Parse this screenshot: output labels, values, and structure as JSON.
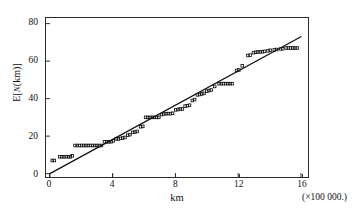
{
  "figure": {
    "background_color": "#ffffff",
    "ink_color": "#111111",
    "frame_color": "#2b2b2b"
  },
  "axes": {
    "y_title_prefix": "E[",
    "y_title_n": "N",
    "y_title_suffix": "(km)]",
    "x_title": "km",
    "x_multiplier": "(×100 000.)"
  },
  "chart_data": {
    "type": "scatter",
    "title": "",
    "subtitle": "",
    "xlabel": "km",
    "ylabel": "E[N(km)]",
    "x_multiplier_note": "(×100 000.)",
    "xlim": [
      -0.25,
      16.45
    ],
    "ylim": [
      -1.8,
      83.0
    ],
    "xticks": [
      0,
      4,
      8,
      12,
      16
    ],
    "xticklabels": [
      "0",
      "4",
      "8",
      "12",
      "16"
    ],
    "yticks": [
      0,
      20,
      40,
      60,
      80
    ],
    "yticklabels": [
      "0",
      "20",
      "40",
      "60",
      "80"
    ],
    "grid": false,
    "legend": null,
    "legend_position": "none",
    "marker": "open-square",
    "marker_size_px": 2.6,
    "series": [
      {
        "name": "empirical",
        "type": "scatter",
        "marker": "open-square",
        "color": "#111111",
        "points": [
          [
            0.15,
            7.0
          ],
          [
            0.28,
            7.0
          ],
          [
            0.62,
            9.0
          ],
          [
            0.76,
            9.0
          ],
          [
            0.9,
            9.0
          ],
          [
            1.04,
            9.0
          ],
          [
            1.18,
            9.0
          ],
          [
            1.3,
            9.0
          ],
          [
            1.42,
            9.5
          ],
          [
            1.6,
            15.0
          ],
          [
            1.74,
            15.0
          ],
          [
            1.88,
            15.0
          ],
          [
            2.02,
            15.0
          ],
          [
            2.16,
            15.0
          ],
          [
            2.3,
            15.0
          ],
          [
            2.44,
            15.0
          ],
          [
            2.58,
            15.0
          ],
          [
            2.72,
            15.0
          ],
          [
            2.86,
            15.0
          ],
          [
            3.0,
            15.0
          ],
          [
            3.14,
            15.0
          ],
          [
            3.28,
            15.0
          ],
          [
            3.48,
            17.0
          ],
          [
            3.62,
            17.0
          ],
          [
            3.76,
            17.0
          ],
          [
            3.9,
            17.0
          ],
          [
            4.04,
            17.5
          ],
          [
            4.22,
            18.5
          ],
          [
            4.36,
            18.5
          ],
          [
            4.5,
            18.8
          ],
          [
            4.64,
            19.0
          ],
          [
            4.78,
            19.3
          ],
          [
            4.96,
            20.5
          ],
          [
            5.1,
            20.8
          ],
          [
            5.28,
            22.0
          ],
          [
            5.42,
            22.2
          ],
          [
            5.56,
            22.5
          ],
          [
            5.78,
            25.0
          ],
          [
            5.92,
            25.2
          ],
          [
            6.1,
            30.0
          ],
          [
            6.24,
            30.0
          ],
          [
            6.38,
            30.0
          ],
          [
            6.52,
            30.0
          ],
          [
            6.66,
            30.0
          ],
          [
            6.8,
            30.0
          ],
          [
            6.94,
            30.0
          ],
          [
            7.12,
            31.5
          ],
          [
            7.26,
            31.8
          ],
          [
            7.4,
            32.0
          ],
          [
            7.54,
            32.0
          ],
          [
            7.68,
            32.0
          ],
          [
            7.82,
            32.2
          ],
          [
            8.02,
            34.0
          ],
          [
            8.16,
            34.2
          ],
          [
            8.3,
            34.5
          ],
          [
            8.44,
            34.5
          ],
          [
            8.62,
            36.0
          ],
          [
            8.76,
            36.2
          ],
          [
            8.9,
            36.5
          ],
          [
            9.08,
            39.0
          ],
          [
            9.22,
            39.5
          ],
          [
            9.4,
            42.0
          ],
          [
            9.54,
            42.2
          ],
          [
            9.68,
            42.5
          ],
          [
            9.82,
            42.8
          ],
          [
            10.0,
            44.0
          ],
          [
            10.14,
            44.3
          ],
          [
            10.28,
            44.6
          ],
          [
            10.5,
            46.5
          ],
          [
            10.78,
            48.0
          ],
          [
            10.92,
            48.0
          ],
          [
            11.06,
            48.0
          ],
          [
            11.2,
            48.0
          ],
          [
            11.34,
            48.0
          ],
          [
            11.48,
            48.0
          ],
          [
            11.62,
            48.0
          ],
          [
            11.9,
            55.0
          ],
          [
            12.04,
            55.3
          ],
          [
            12.26,
            57.5
          ],
          [
            12.62,
            63.0
          ],
          [
            12.76,
            63.2
          ],
          [
            12.98,
            64.5
          ],
          [
            13.12,
            64.7
          ],
          [
            13.26,
            64.9
          ],
          [
            13.4,
            65.0
          ],
          [
            13.54,
            65.0
          ],
          [
            13.68,
            65.2
          ],
          [
            13.9,
            65.5
          ],
          [
            14.04,
            65.8
          ],
          [
            14.3,
            66.0
          ],
          [
            14.44,
            66.2
          ],
          [
            14.7,
            66.5
          ],
          [
            14.84,
            66.6
          ],
          [
            15.06,
            67.0
          ],
          [
            15.2,
            67.0
          ],
          [
            15.34,
            67.0
          ],
          [
            15.48,
            67.0
          ],
          [
            15.62,
            67.0
          ],
          [
            15.76,
            67.0
          ]
        ]
      },
      {
        "name": "fitted-line",
        "type": "line",
        "color": "#111111",
        "linewidth_px": 1.3,
        "endpoints": [
          [
            0.0,
            0.0
          ],
          [
            16.0,
            73.0
          ]
        ],
        "slope": 4.5625,
        "intercept": 0.0
      }
    ]
  }
}
